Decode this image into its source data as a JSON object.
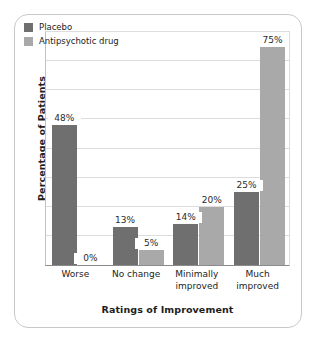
{
  "chart_data": {
    "type": "bar",
    "title": "",
    "subtitle": "",
    "xlabel": "Ratings of Improvement",
    "ylabel": "Percentage of Patients",
    "categories": [
      "Worse",
      "No change",
      "Minimally improved",
      "Much improved"
    ],
    "category_lines": [
      [
        "Worse"
      ],
      [
        "No change"
      ],
      [
        "Minimally",
        "improved"
      ],
      [
        "Much",
        "improved"
      ]
    ],
    "series": [
      {
        "name": "Placebo",
        "color": "#6f6f6f",
        "values": [
          48,
          13,
          14,
          25
        ],
        "labels": [
          "48%",
          "13%",
          "14%",
          "25%"
        ]
      },
      {
        "name": "Antipsychotic drug",
        "color": "#a9a9a9",
        "values": [
          0,
          5,
          20,
          75
        ],
        "labels": [
          "0%",
          "5%",
          "20%",
          "75%"
        ]
      }
    ],
    "ylim": [
      0,
      80
    ],
    "y_tick_labels": [],
    "gridlines": [
      10,
      20,
      30,
      40,
      50,
      60,
      70,
      80
    ],
    "grid": true,
    "legend_position": "top-left",
    "units": "percent"
  },
  "frame": {
    "border_color": "#c9c9c9",
    "background": "#ffffff"
  }
}
